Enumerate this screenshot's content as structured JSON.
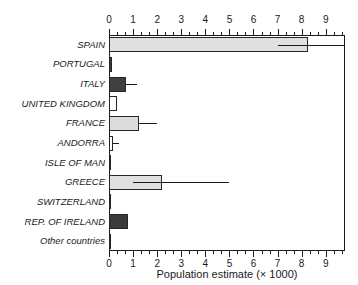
{
  "chart_data": {
    "type": "bar",
    "orientation": "horizontal",
    "title": "",
    "xlabel": "Population estimate (× 1000)",
    "ylabel": "",
    "xlim": [
      0,
      9.8
    ],
    "xticks": [
      0,
      1,
      2,
      3,
      4,
      5,
      6,
      7,
      8,
      9
    ],
    "xtick_labels": [
      "0",
      "1",
      "2",
      "3",
      "4",
      "5",
      "6",
      "7",
      "8",
      "9"
    ],
    "minor_ticks_per_interval": 2,
    "grid": false,
    "legend": false,
    "axis_top": true,
    "axis_bottom": true,
    "categories": [
      "SPAIN",
      "PORTUGAL",
      "ITALY",
      "UNITED KINGDOM",
      "FRANCE",
      "ANDORRA",
      "ISLE OF MAN",
      "GREECE",
      "SWITZERLAND",
      "REP. OF IRELAND",
      "Other countries"
    ],
    "values": [
      8.25,
      0.12,
      0.72,
      0.35,
      1.25,
      0.16,
      0.05,
      2.2,
      0.06,
      0.78,
      0.03
    ],
    "errors_low": [
      7.0,
      null,
      0.72,
      null,
      1.25,
      0.16,
      null,
      1.0,
      null,
      null,
      null
    ],
    "errors_high": [
      9.75,
      null,
      1.15,
      null,
      2.0,
      0.42,
      null,
      5.0,
      null,
      null,
      null
    ],
    "bar_fills": [
      "#e0e0e0",
      "#383838",
      "#404040",
      "#ffffff",
      "#dcdcdc",
      "#ffffff",
      "#3a3a3a",
      "#e0e0e0",
      "#3a3a3a",
      "#3a3a3a",
      "#777777"
    ],
    "bar_edge_color": "#262626",
    "error_bar_color": "#1a1a1a",
    "frame_color": "#1a1a1a",
    "background": "#ffffff"
  }
}
